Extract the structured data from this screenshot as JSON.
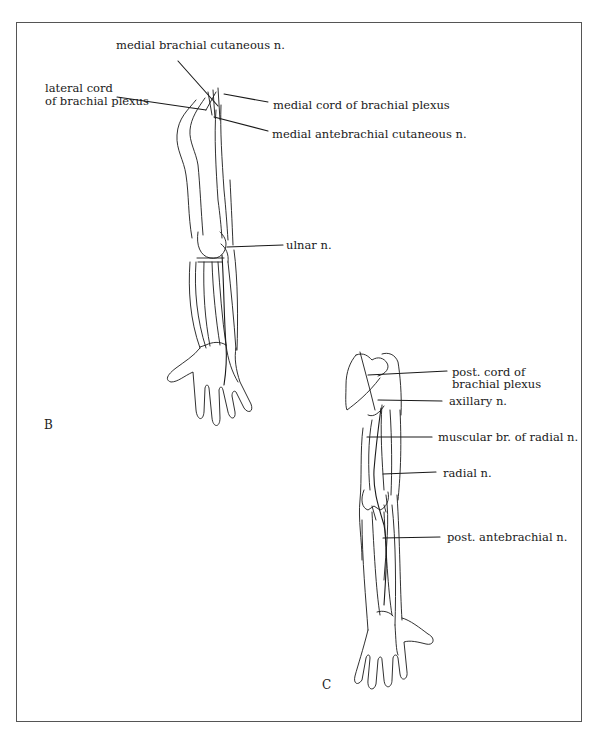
{
  "page": {
    "header_fragment": "Appendix"
  },
  "figure": {
    "panels": [
      {
        "id": "B",
        "letter": "B",
        "labels": {
          "medial_brachial_cutaneous": "medial brachial cutaneous n.",
          "lateral_cord_line1": "lateral cord",
          "lateral_cord_line2": "of brachial plexus",
          "medial_cord": "medial cord of brachial plexus",
          "medial_antebrachial_cutaneous": "medial antebrachial cutaneous n.",
          "ulnar": "ulnar n."
        }
      },
      {
        "id": "C",
        "letter": "C",
        "labels": {
          "post_cord_line1": "post. cord of",
          "post_cord_line2": "brachial plexus",
          "axillary": "axillary n.",
          "muscular_br_radial": "muscular br. of radial n.",
          "radial": "radial n.",
          "post_antebrachial": "post. antebrachial n."
        }
      }
    ],
    "colors": {
      "ink": "#1a1a1a",
      "frame": "#555555",
      "background": "#ffffff"
    }
  }
}
